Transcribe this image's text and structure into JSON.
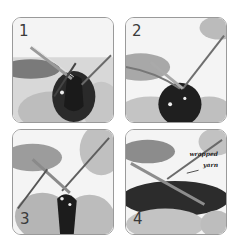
{
  "figure": {
    "panels": [
      {
        "step": "1"
      },
      {
        "step": "2"
      },
      {
        "step": "3"
      },
      {
        "step": "4",
        "annotation": {
          "line1": "wrapped",
          "line2": "yarn"
        }
      }
    ]
  }
}
